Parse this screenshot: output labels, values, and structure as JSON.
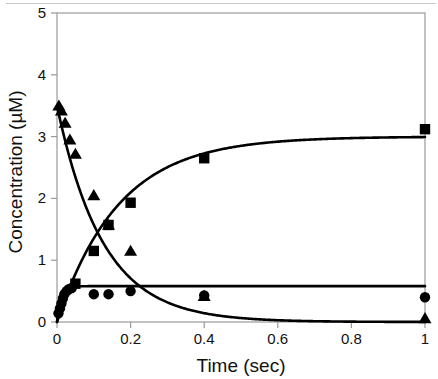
{
  "chart_data": {
    "type": "scatter",
    "title": "",
    "xlabel": "Time  (sec)",
    "ylabel": "Concentration  (µM)",
    "xlim": [
      0,
      1
    ],
    "ylim": [
      0,
      5
    ],
    "xticks": [
      0,
      0.2,
      0.4,
      0.6,
      0.8,
      1
    ],
    "xtick_labels": [
      "0",
      "0.2",
      "0.4",
      "0.6",
      "0.8",
      "1"
    ],
    "yticks": [
      0,
      1,
      2,
      3,
      4,
      5
    ],
    "ytick_labels": [
      "0",
      "1",
      "2",
      "3",
      "4",
      "5"
    ],
    "grid": false,
    "legend": false,
    "legend_position": "none",
    "frame": "box",
    "line_color": "#000000",
    "marker_color": "#000000",
    "series": [
      {
        "name": "triangle-series",
        "marker": "triangle",
        "marker_color": "#000000",
        "fit": "exponential-decay",
        "fit_amplitude": 3.5,
        "fit_offset": 0.0,
        "fit_rate": 8.0,
        "points": [
          {
            "x": 0.005,
            "y": 3.5
          },
          {
            "x": 0.012,
            "y": 3.42
          },
          {
            "x": 0.022,
            "y": 3.22
          },
          {
            "x": 0.035,
            "y": 2.95
          },
          {
            "x": 0.05,
            "y": 2.72
          },
          {
            "x": 0.1,
            "y": 2.05
          },
          {
            "x": 0.14,
            "y": 1.57
          },
          {
            "x": 0.2,
            "y": 1.15
          },
          {
            "x": 0.4,
            "y": 0.42
          },
          {
            "x": 1.0,
            "y": 0.06
          }
        ]
      },
      {
        "name": "square-series",
        "marker": "square",
        "marker_color": "#000000",
        "fit": "exponential-rise",
        "fit_amplitude": 3.0,
        "fit_offset": 0.0,
        "fit_rate": 6.0,
        "points": [
          {
            "x": 0.05,
            "y": 0.62
          },
          {
            "x": 0.1,
            "y": 1.15
          },
          {
            "x": 0.14,
            "y": 1.57
          },
          {
            "x": 0.2,
            "y": 1.93
          },
          {
            "x": 0.4,
            "y": 2.65
          },
          {
            "x": 1.0,
            "y": 3.12
          }
        ]
      },
      {
        "name": "circle-series",
        "marker": "circle",
        "marker_color": "#000000",
        "fit": "exponential-rise",
        "fit_amplitude": 0.58,
        "fit_offset": 0.0,
        "fit_rate": 90.0,
        "points": [
          {
            "x": 0.004,
            "y": 0.14
          },
          {
            "x": 0.008,
            "y": 0.22
          },
          {
            "x": 0.012,
            "y": 0.3
          },
          {
            "x": 0.016,
            "y": 0.38
          },
          {
            "x": 0.02,
            "y": 0.45
          },
          {
            "x": 0.026,
            "y": 0.5
          },
          {
            "x": 0.032,
            "y": 0.53
          },
          {
            "x": 0.04,
            "y": 0.55
          },
          {
            "x": 0.1,
            "y": 0.45
          },
          {
            "x": 0.14,
            "y": 0.45
          },
          {
            "x": 0.2,
            "y": 0.5
          },
          {
            "x": 0.4,
            "y": 0.43
          },
          {
            "x": 1.0,
            "y": 0.4
          }
        ]
      }
    ]
  }
}
